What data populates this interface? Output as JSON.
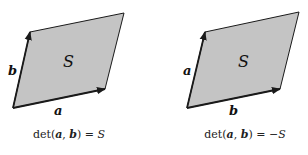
{
  "colors": {
    "fill": "#c4c4c4",
    "stroke": "#1a1a1a"
  },
  "panels": [
    {
      "id": "left",
      "area_label": "S",
      "vector_horizontal_label": "a",
      "vector_vertical_label": "b",
      "formula": {
        "prefix": "det(",
        "v1": "a",
        "comma": ", ",
        "v2": "b",
        "suffix": ") = ",
        "rhs": "S"
      }
    },
    {
      "id": "right",
      "area_label": "S",
      "vector_horizontal_label": "b",
      "vector_vertical_label": "a",
      "formula": {
        "prefix": "det(",
        "v1": "a",
        "comma": ", ",
        "v2": "b",
        "suffix": ") = ",
        "rhs": "−S"
      }
    }
  ]
}
